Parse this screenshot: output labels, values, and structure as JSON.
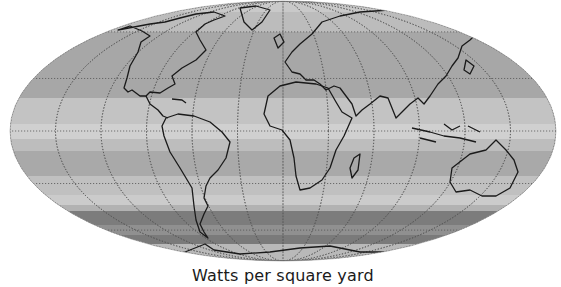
{
  "figure": {
    "projection": "Mollweide",
    "caption": "Watts per square yard",
    "colors": {
      "outline": "#1a1a1a",
      "graticule": "#555555",
      "background": "#ffffff"
    },
    "bands": [
      {
        "y0": 0,
        "y1": 12,
        "fill": "#c9c9c9"
      },
      {
        "y0": 12,
        "y1": 32,
        "fill": "#bcbcbc"
      },
      {
        "y0": 32,
        "y1": 98,
        "fill": "#a7a7a7"
      },
      {
        "y0": 98,
        "y1": 124,
        "fill": "#c3c3c3"
      },
      {
        "y0": 124,
        "y1": 139,
        "fill": "#d0d0d0"
      },
      {
        "y0": 139,
        "y1": 151,
        "fill": "#bdbdbd"
      },
      {
        "y0": 151,
        "y1": 176,
        "fill": "#a9a9a9"
      },
      {
        "y0": 176,
        "y1": 195,
        "fill": "#c0c0c0"
      },
      {
        "y0": 195,
        "y1": 205,
        "fill": "#cbcbcb"
      },
      {
        "y0": 205,
        "y1": 211,
        "fill": "#b2b2b2"
      },
      {
        "y0": 211,
        "y1": 225,
        "fill": "#7c7c7c"
      },
      {
        "y0": 225,
        "y1": 235,
        "fill": "#909090"
      },
      {
        "y0": 235,
        "y1": 244,
        "fill": "#7a7a7a"
      },
      {
        "y0": 244,
        "y1": 262,
        "fill": "#b9b9b9"
      }
    ]
  }
}
